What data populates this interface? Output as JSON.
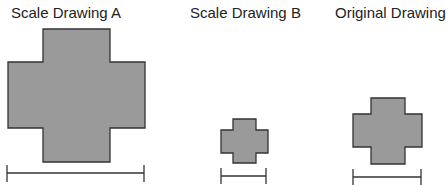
{
  "labels": {
    "a": "Scale Drawing A",
    "b": "Scale Drawing B",
    "original": "Original Drawing"
  },
  "colors": {
    "fill": "#9a9a9a",
    "stroke": "#333333"
  }
}
